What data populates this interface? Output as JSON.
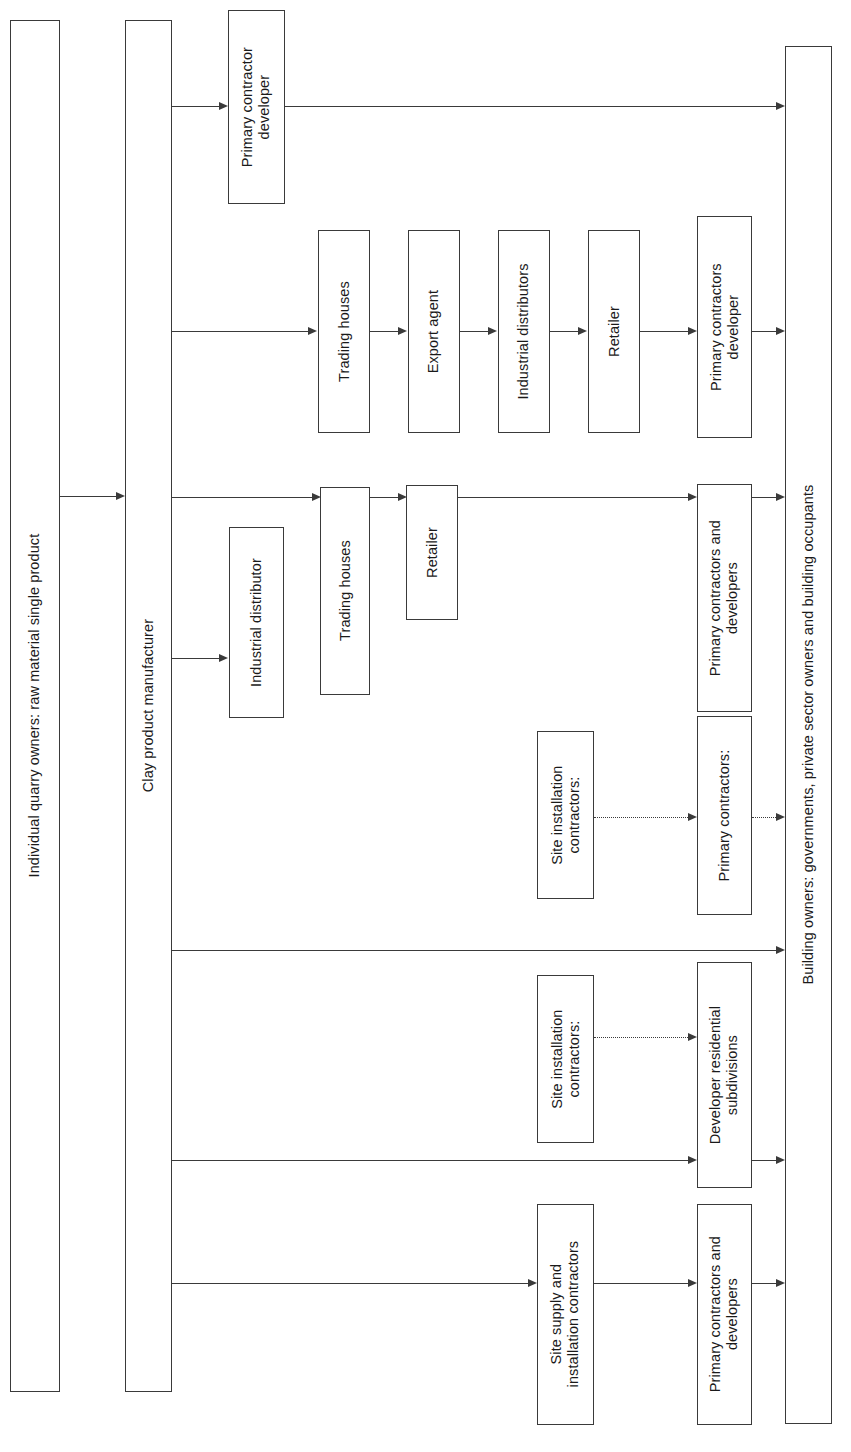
{
  "diagram": {
    "orientation": "rotated-90",
    "line_color": "#3a3a3a",
    "background": "#ffffff",
    "columns": [
      {
        "id": "quarry",
        "label": "Individual quarry owners: raw material single product"
      },
      {
        "id": "niche",
        "label": "Niche market products"
      },
      {
        "id": "manufacturer",
        "label": "Clay product manufacturer"
      },
      {
        "id": "owners",
        "label": "Building owners: governments, private sector owners and building occupants"
      }
    ],
    "nodes": [
      {
        "id": "n1",
        "label": "Primary contractor\ndeveloper"
      },
      {
        "id": "n2",
        "label": "Trading houses"
      },
      {
        "id": "n3",
        "label": "Export agent"
      },
      {
        "id": "n4",
        "label": "Industrial distributors"
      },
      {
        "id": "n5",
        "label": "Retailer"
      },
      {
        "id": "n6",
        "label": "Primary contractors\ndeveloper"
      },
      {
        "id": "n7",
        "label": "Trading houses"
      },
      {
        "id": "n8",
        "label": "Retailer"
      },
      {
        "id": "n9",
        "label": "Primary contractors and\ndevelopers"
      },
      {
        "id": "n10",
        "label": "Industrial distributor"
      },
      {
        "id": "n11",
        "label": "Site installation\ncontractors:"
      },
      {
        "id": "n12",
        "label": "Primary contractors:"
      },
      {
        "id": "n13",
        "label": "Site installation\ncontractors:"
      },
      {
        "id": "n14",
        "label": "Developer residential\nsubdivisions"
      },
      {
        "id": "n15",
        "label": "Site supply and\ninstallation contractors"
      },
      {
        "id": "n16",
        "label": "Primary contractors and\ndevelopers"
      }
    ],
    "edges": [
      {
        "from": "quarry",
        "to": "niche",
        "style": "solid"
      },
      {
        "from": "manufacturer",
        "to": "n1",
        "style": "solid"
      },
      {
        "from": "n1",
        "to": "owners",
        "style": "solid"
      },
      {
        "from": "manufacturer",
        "to": "n2",
        "style": "solid"
      },
      {
        "from": "n2",
        "to": "n3",
        "style": "solid"
      },
      {
        "from": "n3",
        "to": "n4",
        "style": "solid"
      },
      {
        "from": "n4",
        "to": "n5",
        "style": "solid"
      },
      {
        "from": "n5",
        "to": "n6",
        "style": "solid"
      },
      {
        "from": "n6",
        "to": "owners",
        "style": "solid"
      },
      {
        "from": "manufacturer",
        "to": "n7",
        "style": "solid"
      },
      {
        "from": "n7",
        "to": "n8",
        "style": "solid"
      },
      {
        "from": "n8",
        "to": "n9",
        "style": "solid"
      },
      {
        "from": "n9",
        "to": "owners",
        "style": "solid"
      },
      {
        "from": "manufacturer",
        "to": "n10",
        "style": "solid"
      },
      {
        "from": "n11",
        "to": "n12",
        "style": "dotted"
      },
      {
        "from": "n12",
        "to": "owners",
        "style": "dotted"
      },
      {
        "from": "manufacturer",
        "to": "owners",
        "style": "solid"
      },
      {
        "from": "n13",
        "to": "n14",
        "style": "dotted"
      },
      {
        "from": "manufacturer",
        "to": "n14",
        "style": "solid"
      },
      {
        "from": "n14",
        "to": "owners",
        "style": "solid"
      },
      {
        "from": "manufacturer",
        "to": "n15",
        "style": "solid"
      },
      {
        "from": "n15",
        "to": "n16",
        "style": "solid"
      },
      {
        "from": "n16",
        "to": "owners",
        "style": "solid"
      }
    ]
  }
}
